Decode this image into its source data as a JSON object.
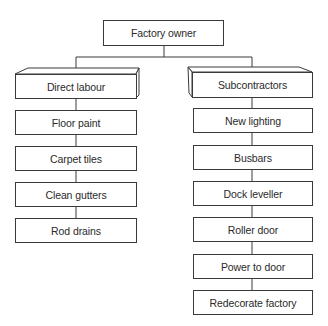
{
  "root": {
    "label": "Factory owner"
  },
  "branches": [
    {
      "label": "Direct labour",
      "items": [
        "Floor paint",
        "Carpet tiles",
        "Clean gutters",
        "Rod drains"
      ]
    },
    {
      "label": "Subcontractors",
      "items": [
        "New lighting",
        "Busbars",
        "Dock leveller",
        "Roller door",
        "Power to door",
        "Redecorate factory"
      ]
    }
  ],
  "colors": {
    "line": "#3a3a3a",
    "background": "#ffffff"
  }
}
